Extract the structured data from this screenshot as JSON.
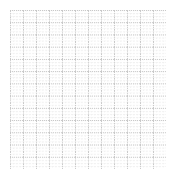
{
  "figure": {
    "width": 173,
    "height": 180,
    "background_color": "#ffffff",
    "title": "",
    "subtitle": ""
  },
  "axes": {
    "left": 10,
    "top": 10,
    "width": 156,
    "height": 159,
    "facecolor": "#ffffff",
    "spines_visible": false,
    "ticks_visible": false,
    "tick_labels_visible": false
  },
  "grid": {
    "visible": true,
    "linestyle": "dotted",
    "major_color": "#bdbdbd",
    "minor_color": "#e2e2e2",
    "major_linewidth": 0.8,
    "minor_linewidth": 0.5,
    "major_columns": 12,
    "major_rows": 13,
    "minor_subdivisions": 4,
    "dash_pattern": "1 1"
  },
  "legend": {
    "visible": false,
    "position": "none",
    "entries": []
  },
  "chart_data": {
    "type": "line",
    "title": "",
    "subtitle": "",
    "xlabel": "",
    "ylabel": "",
    "x": [],
    "categories": [],
    "values": [],
    "series": [],
    "annotations": [],
    "xlim": [
      0,
      12
    ],
    "ylim": [
      0,
      13
    ],
    "xticks": [
      0,
      1,
      2,
      3,
      4,
      5,
      6,
      7,
      8,
      9,
      10,
      11,
      12
    ],
    "yticks": [
      0,
      1,
      2,
      3,
      4,
      5,
      6,
      7,
      8,
      9,
      10,
      11,
      12,
      13
    ],
    "xticklabels": [],
    "yticklabels": [],
    "grid": true,
    "legend_position": "none",
    "note": "Empty grid canvas — no data series plotted, no axis labels or tick text rendered."
  }
}
